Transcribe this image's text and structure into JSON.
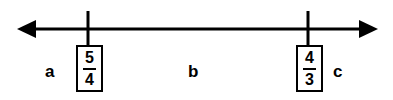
{
  "figure": {
    "type": "number-line",
    "background_color": "#ffffff",
    "ink_color": "#000000"
  },
  "axis": {
    "name": "number-line-axis",
    "left_arrow": "arrow-left",
    "right_arrow": "arrow-right",
    "line_y": 29,
    "line_x_start": 17,
    "line_x_end": 378,
    "double_headed": true
  },
  "ticks": [
    {
      "id": "tick-left",
      "x": 88,
      "label": "5/4"
    },
    {
      "id": "tick-right",
      "x": 308,
      "label": "4/3"
    }
  ],
  "boxes": [
    {
      "id": "box-five-fourths",
      "numerator": "5",
      "denominator": "4",
      "x": 76,
      "y": 45,
      "width": 27,
      "height": 47
    },
    {
      "id": "box-four-thirds",
      "numerator": "4",
      "denominator": "3",
      "x": 296,
      "y": 45,
      "width": 27,
      "height": 47
    }
  ],
  "region_labels": [
    {
      "id": "label-a",
      "text": "a",
      "x": 45,
      "y": 63
    },
    {
      "id": "label-b",
      "text": "b",
      "x": 188,
      "y": 63
    },
    {
      "id": "label-c",
      "text": "c",
      "x": 333,
      "y": 63
    }
  ]
}
